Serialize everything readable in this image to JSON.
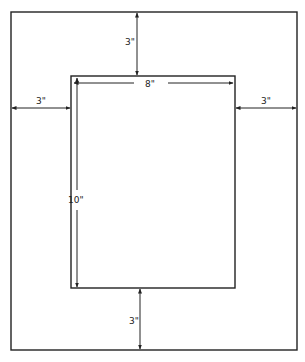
{
  "diagram": {
    "outer_box": {
      "x": 11,
      "y": 12,
      "width": 286,
      "height": 338
    },
    "inner_box": {
      "x": 71,
      "y": 76,
      "width": 164,
      "height": 212
    },
    "line_color": "#222222",
    "dimensions": {
      "top_border": "3\"",
      "bottom_border": "3\"",
      "left_border": "3\"",
      "right_border": "3\"",
      "opening_width": "8\"",
      "opening_height": "10\""
    }
  }
}
